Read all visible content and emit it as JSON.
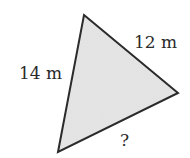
{
  "figure": {
    "shape": "triangle",
    "fill_color": "#e6e6e6",
    "stroke_color": "#2b2b2b",
    "vertices": {
      "top": [
        84,
        15
      ],
      "right": [
        178,
        93
      ],
      "bottom_left": [
        58,
        152
      ]
    }
  },
  "labels": {
    "left_side": "14 m",
    "right_side": "12 m",
    "bottom_side": "?"
  }
}
